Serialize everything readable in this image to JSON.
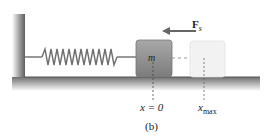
{
  "figure": {
    "caption": "(b)",
    "mass_label": "m",
    "force_label": "F",
    "force_subscript": "s",
    "equilibrium_label": "x = 0",
    "max_label_base": "x",
    "max_label_subscript": "max"
  },
  "colors": {
    "wall": "#6a6a6a",
    "floor": "#7a7a7a",
    "spring": "#707070",
    "block": "#8c8c8c",
    "ghost_block": "#f0f0f0",
    "arrow": "#666666"
  }
}
